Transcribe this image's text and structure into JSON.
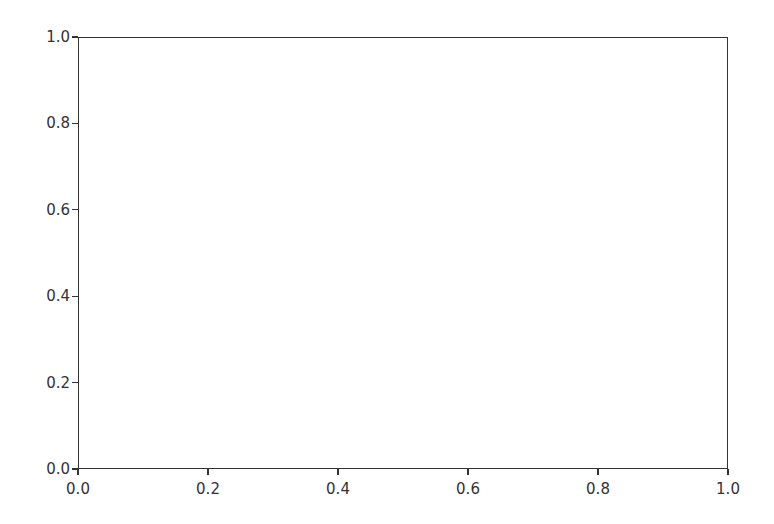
{
  "chart_data": {
    "type": "line",
    "title": "",
    "xlabel": "",
    "ylabel": "",
    "xlim": [
      0.0,
      1.0
    ],
    "ylim": [
      0.0,
      1.0
    ],
    "x_ticks": [
      "0.0",
      "0.2",
      "0.4",
      "0.6",
      "0.8",
      "1.0"
    ],
    "y_ticks": [
      "0.0",
      "0.2",
      "0.4",
      "0.6",
      "0.8",
      "1.0"
    ],
    "series": [],
    "grid": false,
    "legend": null
  },
  "colors": {
    "axis": "#333333",
    "background": "#ffffff"
  }
}
